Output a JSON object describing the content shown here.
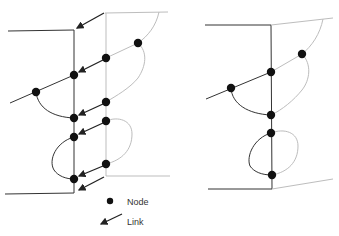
{
  "colors": {
    "dark_line": "#333333",
    "light_line": "#bdbdbd",
    "node": "#111111",
    "text": "#333333",
    "background": "#ffffff"
  },
  "legend": {
    "node_label": "Node",
    "link_label": "Link"
  },
  "diagrams": [
    {
      "id": "left",
      "with_links": true,
      "nodes": [
        {
          "x": 138,
          "y": 43
        },
        {
          "x": 106,
          "y": 58
        },
        {
          "x": 74,
          "y": 75
        },
        {
          "x": 36,
          "y": 92
        },
        {
          "x": 106,
          "y": 102
        },
        {
          "x": 74,
          "y": 118
        },
        {
          "x": 106,
          "y": 121
        },
        {
          "x": 74,
          "y": 137
        },
        {
          "x": 106,
          "y": 164
        },
        {
          "x": 74,
          "y": 179
        }
      ],
      "links": [
        {
          "from": [
            104,
            13
          ],
          "to": [
            76,
            28
          ]
        },
        {
          "from": [
            103,
            60
          ],
          "to": [
            78,
            73
          ]
        },
        {
          "from": [
            103,
            104
          ],
          "to": [
            78,
            116
          ]
        },
        {
          "from": [
            103,
            123
          ],
          "to": [
            78,
            135
          ]
        },
        {
          "from": [
            103,
            166
          ],
          "to": [
            78,
            177
          ]
        },
        {
          "from": [
            104,
            177
          ],
          "to": [
            78,
            190
          ]
        }
      ]
    },
    {
      "id": "right",
      "with_links": false,
      "nodes": [
        {
          "x": 302,
          "y": 54
        },
        {
          "x": 271,
          "y": 72
        },
        {
          "x": 231,
          "y": 88
        },
        {
          "x": 271,
          "y": 115
        },
        {
          "x": 271,
          "y": 133
        },
        {
          "x": 272,
          "y": 175
        }
      ]
    }
  ]
}
